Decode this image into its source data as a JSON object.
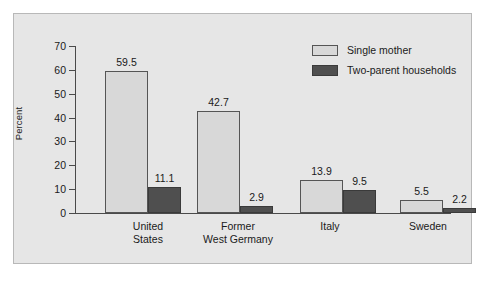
{
  "chart_data": {
    "type": "bar",
    "title": "",
    "subtitle": "",
    "xlabel": "",
    "ylabel": "Percent",
    "ylim": [
      0,
      70
    ],
    "yticks": [
      0,
      10,
      20,
      30,
      40,
      50,
      60,
      70
    ],
    "ytick_labels": [
      "0",
      "10",
      "20",
      "30",
      "40",
      "50",
      "60",
      "70"
    ],
    "grid": false,
    "legend_position": "top-right",
    "categories": [
      "United States",
      "Former West Germany",
      "Italy",
      "Sweden"
    ],
    "category_lines": [
      [
        "United",
        "States"
      ],
      [
        "Former",
        "West Germany"
      ],
      [
        "Italy"
      ],
      [
        "Sweden"
      ]
    ],
    "series": [
      {
        "name": "Single mother",
        "color": "#d8d8d8",
        "values": [
          59.5,
          42.7,
          13.9,
          5.5
        ],
        "value_labels": [
          "59.5",
          "42.7",
          "13.9",
          "5.5"
        ]
      },
      {
        "name": "Two-parent households",
        "color": "#4f4f4f",
        "values": [
          11.1,
          2.9,
          9.5,
          2.2
        ],
        "value_labels": [
          "11.1",
          "2.9",
          "9.5",
          "2.2"
        ]
      }
    ]
  },
  "legend": {
    "items": [
      {
        "label": "Single mother",
        "swatch": "light"
      },
      {
        "label": "Two-parent households",
        "swatch": "dark"
      }
    ]
  },
  "colors": {
    "page_background": "#ffffff",
    "panel_background": "#e6e6e6",
    "panel_border": "#b8b8b8",
    "axis": "#4a4a4a",
    "series_light": "#d8d8d8",
    "series_dark": "#4f4f4f",
    "text": "#1a1a1a"
  }
}
